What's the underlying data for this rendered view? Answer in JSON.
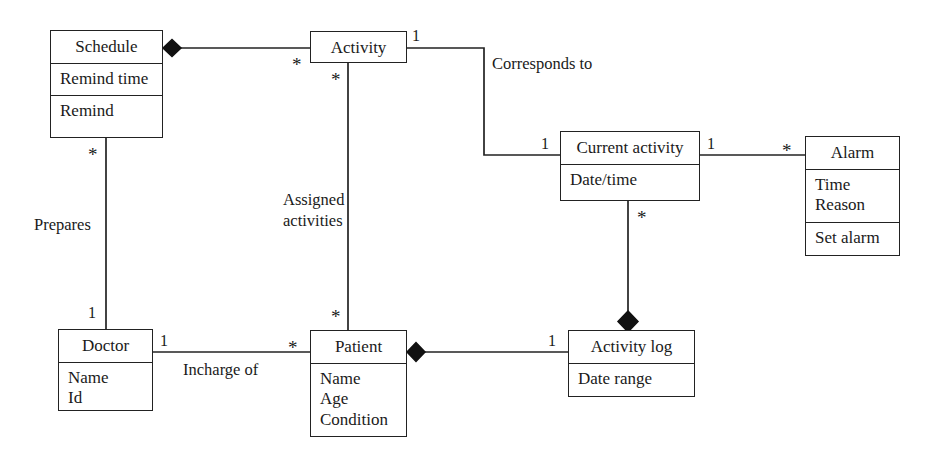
{
  "diagram": {
    "type": "uml-class-diagram",
    "title": "",
    "stroke_color": "#222222",
    "background_color": "#ffffff",
    "classes": [
      {
        "id": "schedule",
        "name": "Schedule",
        "compartments": [
          [
            "Remind time"
          ],
          [
            "Remind"
          ]
        ],
        "x": 50,
        "y": 30,
        "w": 113,
        "h": 108
      },
      {
        "id": "activity",
        "name": "Activity",
        "compartments": [],
        "x": 310,
        "y": 31,
        "w": 97,
        "h": 32
      },
      {
        "id": "current-activity",
        "name": "Current activity",
        "compartments": [
          [
            "Date/time"
          ]
        ],
        "x": 560,
        "y": 131,
        "w": 140,
        "h": 70
      },
      {
        "id": "alarm",
        "name": "Alarm",
        "compartments": [
          [
            "Time",
            "Reason"
          ],
          [
            "Set alarm"
          ]
        ],
        "x": 805,
        "y": 136,
        "w": 95,
        "h": 120
      },
      {
        "id": "doctor",
        "name": "Doctor",
        "compartments": [
          [
            "Name",
            "Id"
          ]
        ],
        "x": 58,
        "y": 329,
        "w": 95,
        "h": 82
      },
      {
        "id": "patient",
        "name": "Patient",
        "compartments": [
          [
            "Name",
            "Age",
            "Condition"
          ]
        ],
        "x": 310,
        "y": 330,
        "w": 97,
        "h": 107
      },
      {
        "id": "activity-log",
        "name": "Activity log",
        "compartments": [
          [
            "Date range"
          ]
        ],
        "x": 568,
        "y": 330,
        "w": 127,
        "h": 67
      }
    ],
    "associations": [
      {
        "id": "schedule-activity",
        "from": "activity",
        "to": "schedule",
        "label": "",
        "aggregation": "composite-at-schedule",
        "from_multiplicity": "*",
        "to_multiplicity": ""
      },
      {
        "id": "activity-current-activity",
        "from": "activity",
        "to": "current-activity",
        "label": "Corresponds to",
        "from_multiplicity": "1",
        "to_multiplicity": "1"
      },
      {
        "id": "current-activity-alarm",
        "from": "current-activity",
        "to": "alarm",
        "label": "",
        "from_multiplicity": "1",
        "to_multiplicity": "*"
      },
      {
        "id": "schedule-doctor",
        "from": "schedule",
        "to": "doctor",
        "label": "Prepares",
        "from_multiplicity": "*",
        "to_multiplicity": "1"
      },
      {
        "id": "activity-patient",
        "from": "activity",
        "to": "patient",
        "label": "Assigned activities",
        "from_multiplicity": "*",
        "to_multiplicity": "*"
      },
      {
        "id": "doctor-patient",
        "from": "doctor",
        "to": "patient",
        "label": "Incharge of",
        "from_multiplicity": "1",
        "to_multiplicity": "*"
      },
      {
        "id": "patient-activity-log",
        "from": "patient",
        "to": "activity-log",
        "label": "",
        "aggregation": "composite-at-patient",
        "from_multiplicity": "",
        "to_multiplicity": "1"
      },
      {
        "id": "current-activity-activity-log",
        "from": "current-activity",
        "to": "activity-log",
        "label": "",
        "aggregation": "composite-at-activity-log",
        "from_multiplicity": "*",
        "to_multiplicity": ""
      }
    ],
    "labels": {
      "corresponds_to": "Corresponds to",
      "assigned_activities_line1": "Assigned",
      "assigned_activities_line2": "activities",
      "prepares": "Prepares",
      "incharge_of": "Incharge of"
    },
    "multiplicities": {
      "activity_to_schedule": "*",
      "activity_right": "1",
      "current_activity_left": "1",
      "current_activity_right": "1",
      "alarm_left": "*",
      "schedule_bottom": "*",
      "doctor_top": "1",
      "activity_bottom": "*",
      "patient_top": "*",
      "doctor_right": "1",
      "patient_left": "*",
      "activity_log_left": "1",
      "current_activity_bottom": "*"
    }
  }
}
